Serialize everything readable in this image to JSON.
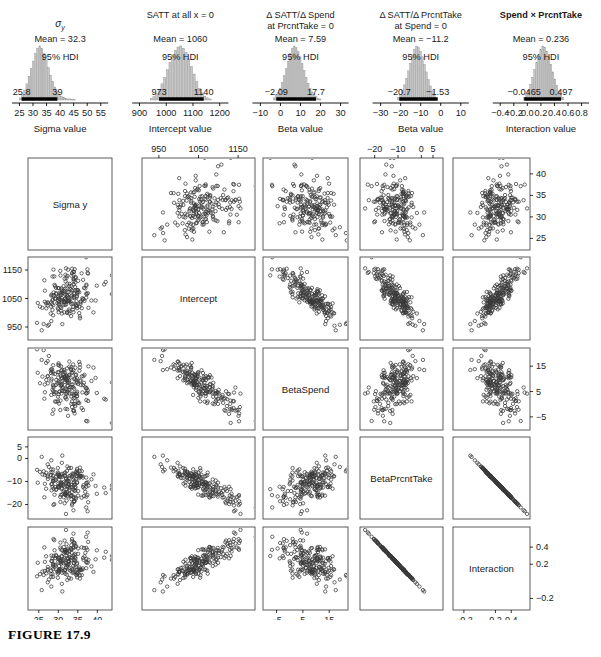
{
  "figure": {
    "caption": "FIGURE 17.9"
  },
  "chart_data": {
    "type": "scatter",
    "title": "FIGURE 17.9",
    "posteriors": [
      {
        "title_lines": [
          "σ",
          "y"
        ],
        "title_is_sigma": true,
        "title_bold": false,
        "mean_label": "Mean = 32.3",
        "mean": 32.3,
        "hdi_label": "95% HDI",
        "hdi_low_label": "25.8",
        "hdi_high_label": "39",
        "hdi": [
          25.8,
          39
        ],
        "xlabel": "Sigma value",
        "ticks": [
          "25",
          "30",
          "35",
          "40",
          "45",
          "50",
          "55"
        ],
        "tickvals": [
          25,
          30,
          35,
          40,
          45,
          50,
          55
        ],
        "xlim": [
          23,
          57
        ],
        "bar_centers": [
          25.4,
          26.2,
          27.0,
          27.8,
          28.6,
          29.4,
          30.2,
          31.0,
          31.8,
          32.6,
          33.4,
          34.2,
          35.0,
          35.8,
          36.6,
          37.4,
          38.2,
          39.0,
          39.8,
          40.6,
          41.4,
          42.2,
          43.0,
          43.8,
          44.6,
          45.4
        ],
        "bar_heights": [
          0.04,
          0.1,
          0.18,
          0.3,
          0.44,
          0.58,
          0.72,
          0.86,
          0.96,
          1.0,
          0.95,
          0.86,
          0.74,
          0.6,
          0.46,
          0.34,
          0.24,
          0.16,
          0.1,
          0.07,
          0.05,
          0.03,
          0.02,
          0.02,
          0.01,
          0.01
        ]
      },
      {
        "title_lines": [
          "SATT at all x = 0"
        ],
        "title_is_sigma": false,
        "title_bold": false,
        "mean_label": "Mean = 1060",
        "mean": 1060,
        "hdi_label": "95% HDI",
        "hdi_low_label": "973",
        "hdi_high_label": "1140",
        "hdi": [
          973,
          1140
        ],
        "xlabel": "Intercept value",
        "ticks": [
          "900",
          "1000",
          "1100",
          "1200"
        ],
        "tickvals": [
          900,
          1000,
          1100,
          1200
        ],
        "xlim": [
          880,
          1225
        ],
        "bar_centers": [
          945,
          955,
          965,
          975,
          985,
          995,
          1005,
          1015,
          1025,
          1035,
          1045,
          1055,
          1065,
          1075,
          1085,
          1095,
          1105,
          1115,
          1125,
          1135,
          1145,
          1155,
          1165
        ],
        "bar_heights": [
          0.03,
          0.06,
          0.12,
          0.2,
          0.3,
          0.42,
          0.56,
          0.7,
          0.82,
          0.92,
          0.98,
          1.0,
          0.96,
          0.88,
          0.76,
          0.62,
          0.48,
          0.34,
          0.22,
          0.13,
          0.07,
          0.04,
          0.02
        ]
      },
      {
        "title_lines": [
          "Δ SATT/Δ Spend",
          "at PrcntTake = 0"
        ],
        "title_is_sigma": false,
        "title_bold": false,
        "mean_label": "Mean = 7.59",
        "mean": 7.59,
        "hdi_label": "95% HDI",
        "hdi_low_label": "−2.09",
        "hdi_high_label": "17.7",
        "hdi": [
          -2.09,
          17.7
        ],
        "xlabel": "Beta value",
        "ticks": [
          "−10",
          "0",
          "10",
          "20",
          "30"
        ],
        "tickvals": [
          -10,
          0,
          10,
          20,
          30
        ],
        "xlim": [
          -13,
          33
        ],
        "bar_centers": [
          -3,
          -2,
          -1,
          0,
          1,
          2,
          3,
          4,
          5,
          6,
          7,
          8,
          9,
          10,
          11,
          12,
          13,
          14,
          15,
          16,
          17,
          18,
          19,
          20
        ],
        "bar_heights": [
          0.04,
          0.08,
          0.14,
          0.22,
          0.33,
          0.45,
          0.58,
          0.72,
          0.86,
          0.95,
          1.0,
          0.97,
          0.9,
          0.8,
          0.68,
          0.55,
          0.42,
          0.31,
          0.22,
          0.15,
          0.1,
          0.06,
          0.03,
          0.02
        ]
      },
      {
        "title_lines": [
          "Δ SATT/Δ PrcntTake",
          "at Spend = 0"
        ],
        "title_is_sigma": false,
        "title_bold": false,
        "mean_label": "Mean = −11.2",
        "mean": -11.2,
        "hdi_label": "95% HDI",
        "hdi_low_label": "−20.7",
        "hdi_high_label": "−1.53",
        "hdi": [
          -20.7,
          -1.53
        ],
        "xlabel": "Beta value",
        "ticks": [
          "−30",
          "−20",
          "−10",
          "0",
          "10"
        ],
        "tickvals": [
          -30,
          -20,
          -10,
          0,
          10
        ],
        "xlim": [
          -33,
          13
        ],
        "bar_centers": [
          -21,
          -20,
          -19,
          -18,
          -17,
          -16,
          -15,
          -14,
          -13,
          -12,
          -11,
          -10,
          -9,
          -8,
          -7,
          -6,
          -5,
          -4,
          -3,
          -2
        ],
        "bar_heights": [
          0.05,
          0.1,
          0.18,
          0.28,
          0.4,
          0.54,
          0.68,
          0.82,
          0.93,
          1.0,
          0.98,
          0.9,
          0.8,
          0.66,
          0.52,
          0.38,
          0.26,
          0.16,
          0.09,
          0.04
        ]
      },
      {
        "title_lines": [
          "Spend × PrcntTake"
        ],
        "title_is_sigma": false,
        "title_bold": true,
        "mean_label": "Mean = 0.236",
        "mean": 0.236,
        "hdi_label": "95% HDI",
        "hdi_low_label": "−0.0465",
        "hdi_high_label": "0.497",
        "hdi": [
          -0.0465,
          0.497
        ],
        "xlabel": "Interaction value",
        "ticks": [
          "−0.4",
          "−0.2",
          "0.0",
          "0.2",
          "0.4",
          "0.6",
          "0.8"
        ],
        "tickvals": [
          -0.4,
          -0.2,
          0.0,
          0.2,
          0.4,
          0.6,
          0.8
        ],
        "xlim": [
          -0.48,
          0.88
        ],
        "bar_centers": [
          -0.04,
          -0.01,
          0.02,
          0.05,
          0.08,
          0.11,
          0.14,
          0.17,
          0.2,
          0.23,
          0.26,
          0.29,
          0.32,
          0.35,
          0.38,
          0.41,
          0.44,
          0.47,
          0.5,
          0.53
        ],
        "bar_heights": [
          0.05,
          0.1,
          0.18,
          0.29,
          0.42,
          0.56,
          0.7,
          0.84,
          0.94,
          1.0,
          0.97,
          0.9,
          0.79,
          0.66,
          0.52,
          0.39,
          0.27,
          0.17,
          0.1,
          0.05
        ]
      }
    ],
    "pairs_matrix": {
      "variables": [
        "Sigma y",
        "Intercept",
        "BetaSpend",
        "BetaPrcntTake",
        "Interaction"
      ],
      "axis_ticks": {
        "Sigma y": {
          "labels": [
            "25",
            "30",
            "35",
            "40"
          ],
          "values": [
            25,
            30,
            35,
            40
          ],
          "lim": [
            23,
            43
          ]
        },
        "Intercept": {
          "labels": [
            "950",
            "1050",
            "1150"
          ],
          "values": [
            950,
            1050,
            1150
          ],
          "lim": [
            915,
            1185
          ]
        },
        "BetaSpend": {
          "labels": [
            "−5",
            "5",
            "15"
          ],
          "values": [
            -5,
            5,
            15
          ],
          "lim": [
            -9,
            21
          ]
        },
        "BetaPrcntTake": {
          "labels": [
            "−20",
            "−10",
            "0",
            "5"
          ],
          "values": [
            -20,
            -10,
            0,
            5
          ],
          "lim": [
            -25,
            8
          ]
        },
        "Interaction": {
          "labels": [
            "−0.2",
            "0.2",
            "0.4"
          ],
          "values": [
            -0.2,
            0.2,
            0.4
          ],
          "lim": [
            -0.3,
            0.6
          ]
        }
      },
      "tick_placement": {
        "top": [
          "Intercept",
          "BetaPrcntTake"
        ],
        "bottom": [
          "Sigma y",
          "BetaSpend",
          "Interaction"
        ],
        "left": [
          "Intercept",
          "BetaPrcntTake"
        ],
        "right": [
          "Sigma y",
          "BetaSpend",
          "Interaction"
        ]
      },
      "correlations": {
        "Sigma y|Intercept": 0.28,
        "Sigma y|BetaSpend": -0.05,
        "Sigma y|BetaPrcntTake": -0.12,
        "Sigma y|Interaction": 0.1,
        "Intercept|BetaSpend": -0.85,
        "Intercept|BetaPrcntTake": -0.82,
        "Intercept|Interaction": 0.78,
        "BetaSpend|BetaPrcntTake": 0.55,
        "BetaSpend|Interaction": -0.6,
        "BetaPrcntTake|Interaction": -0.995
      },
      "n_points": 200
    }
  }
}
